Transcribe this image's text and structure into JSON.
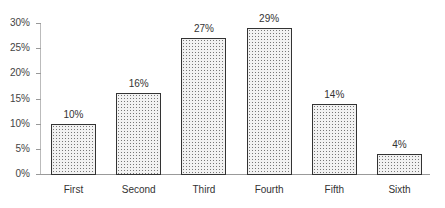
{
  "chart_data": {
    "type": "bar",
    "title": "",
    "xlabel": "",
    "ylabel": "",
    "categories": [
      "First",
      "Second",
      "Third",
      "Fourth",
      "Fifth",
      "Sixth"
    ],
    "values": [
      10,
      16,
      27,
      29,
      14,
      4
    ],
    "value_labels": [
      "10%",
      "16%",
      "27%",
      "29%",
      "14%",
      "4%"
    ],
    "ylim": [
      0,
      30
    ],
    "yticks": [
      0,
      5,
      10,
      15,
      20,
      25,
      30
    ],
    "ytick_labels": [
      "0%",
      "5%",
      "10%",
      "15%",
      "20%",
      "25%",
      "30%"
    ],
    "grid": false,
    "legend": null,
    "bar_fill": "dotted pattern (stippled gray)",
    "bar_edge_color": "#333333"
  }
}
